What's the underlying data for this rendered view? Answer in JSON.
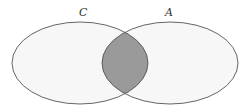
{
  "diagram": {
    "type": "venn",
    "sets": [
      {
        "label": "C",
        "cx": 80,
        "cy": 63,
        "rx": 68,
        "ry": 41
      },
      {
        "label": "A",
        "cx": 170,
        "cy": 63,
        "rx": 68,
        "ry": 41
      }
    ],
    "shaded_region": "C ∩ A",
    "colors": {
      "outline": "#555555",
      "set_fill": "#f7f7f7",
      "shaded_fill": "#9a9a9a",
      "label": "#333333"
    }
  }
}
